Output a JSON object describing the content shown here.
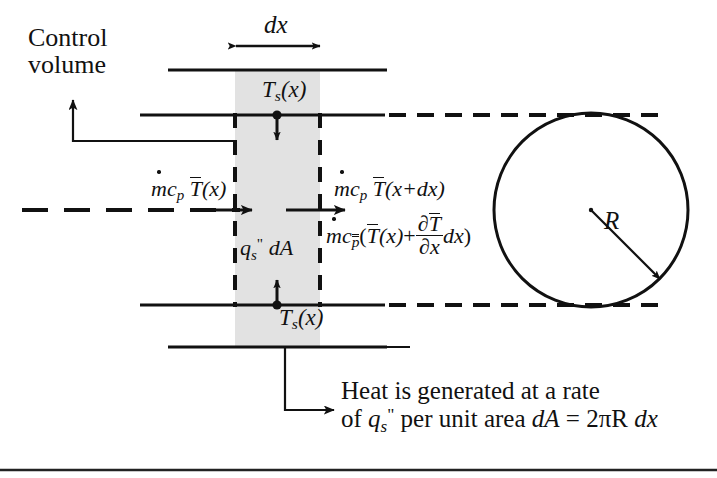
{
  "figure": {
    "domain_type": "engineering-diagram",
    "title_absent": true,
    "background": "#ffffff",
    "line_color": "#111111",
    "shade_color": "#e2e2e2"
  },
  "labels": {
    "control_volume_line1": "Control",
    "control_volume_line2": "volume",
    "dx": "dx",
    "surface_temp_top": "T",
    "surface_temp_top_sub": "s",
    "surface_temp_top_arg": "(x)",
    "surface_temp_bottom": "T",
    "surface_temp_bottom_sub": "s",
    "surface_temp_bottom_arg": "(x)",
    "radius": "R"
  },
  "equations": {
    "inflow": {
      "mdot": "m",
      "cp": "c",
      "cp_sub": "p",
      "Tbar": "T",
      "arg": "(x)"
    },
    "outflow": {
      "mdot": "m",
      "cp": "c",
      "cp_sub": "p",
      "Tbar": "T",
      "arg": "(x+dx)"
    },
    "outflow_expanded": {
      "mdot": "m",
      "cp": "c",
      "cp_sub": "p",
      "open": "(",
      "Tbar": "T",
      "arg": "(x)",
      "plus": "+",
      "frac_num_partial": "∂",
      "frac_num_Tbar": "T",
      "frac_den_partial": "∂",
      "frac_den_x": "x",
      "dx": "dx",
      "close": ")"
    },
    "surface_flux": {
      "q": "q",
      "sub": "s",
      "sup": "\"",
      "dA": "dA"
    }
  },
  "caption": {
    "line1": "Heat is generated at a rate",
    "line2_a": "of ",
    "line2_q": "q",
    "line2_q_sub": "s",
    "line2_q_sup": "\"",
    "line2_b": " per unit area ",
    "line2_dA": "dA",
    "line2_eq": " = 2πR ",
    "line2_dx": "dx"
  },
  "geometry": {
    "shaded_band_x": [
      235,
      320
    ],
    "control_volume_box": {
      "left": 235,
      "top": 115,
      "right": 320,
      "bottom": 305
    },
    "pipe_walls_y": {
      "outer_top": 70,
      "inner_top": 115,
      "inner_bottom": 305,
      "outer_bottom": 347
    },
    "centerline_y": 210,
    "circle": {
      "cx": 591,
      "cy": 210,
      "r": 97
    },
    "bottom_rule_y": 470
  }
}
